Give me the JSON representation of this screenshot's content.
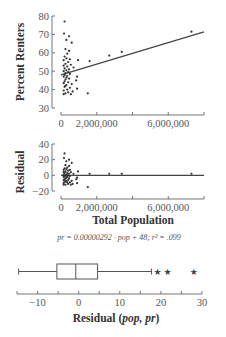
{
  "chart_data": [
    {
      "type": "scatter",
      "title": "",
      "xlabel": "",
      "ylabel": "Percent Renters",
      "xlim": [
        0,
        8000000
      ],
      "ylim": [
        30,
        80
      ],
      "x_ticks": [
        0,
        2000000,
        4000000,
        6000000,
        8000000
      ],
      "x_tick_labels": [
        "0",
        "2,000,000",
        "",
        "6,000,000",
        ""
      ],
      "y_ticks": [
        30,
        40,
        50,
        60,
        70,
        80
      ],
      "y_tick_labels": [
        "30",
        "40",
        "50",
        "60",
        "70",
        "80"
      ],
      "regression_line": {
        "x": [
          0,
          8000000
        ],
        "y": [
          48,
          71.4
        ]
      },
      "points": [
        [
          200000,
          77
        ],
        [
          170000,
          70.5
        ],
        [
          450000,
          69
        ],
        [
          300000,
          67
        ],
        [
          600000,
          65.5
        ],
        [
          250000,
          62
        ],
        [
          450000,
          61
        ],
        [
          350000,
          59.5
        ],
        [
          200000,
          58
        ],
        [
          300000,
          57
        ],
        [
          500000,
          56.5
        ],
        [
          950000,
          56
        ],
        [
          150000,
          56
        ],
        [
          400000,
          55
        ],
        [
          250000,
          54
        ],
        [
          550000,
          53.5
        ],
        [
          150000,
          53
        ],
        [
          350000,
          52.5
        ],
        [
          700000,
          52
        ],
        [
          200000,
          51.5
        ],
        [
          450000,
          51
        ],
        [
          300000,
          50.5
        ],
        [
          150000,
          50
        ],
        [
          400000,
          49.5
        ],
        [
          250000,
          49
        ],
        [
          500000,
          48.5
        ],
        [
          200000,
          48
        ],
        [
          350000,
          47.5
        ],
        [
          150000,
          47
        ],
        [
          900000,
          47
        ],
        [
          300000,
          46.5
        ],
        [
          450000,
          46
        ],
        [
          250000,
          45.5
        ],
        [
          850000,
          45
        ],
        [
          200000,
          44.5
        ],
        [
          400000,
          44
        ],
        [
          150000,
          43.5
        ],
        [
          600000,
          43
        ],
        [
          300000,
          42.5
        ],
        [
          250000,
          42
        ],
        [
          200000,
          41.5
        ],
        [
          500000,
          41
        ],
        [
          900000,
          40.5
        ],
        [
          350000,
          40
        ],
        [
          150000,
          39.5
        ],
        [
          650000,
          39
        ],
        [
          400000,
          38.5
        ],
        [
          250000,
          38
        ],
        [
          150000,
          37.5
        ],
        [
          550000,
          37.5
        ],
        [
          1600000,
          55.5
        ],
        [
          2700000,
          58.5
        ],
        [
          3400000,
          60.5
        ],
        [
          7300000,
          71.5
        ],
        [
          1500000,
          38
        ]
      ]
    },
    {
      "type": "scatter",
      "title": "",
      "xlabel": "Total Population",
      "ylabel": "Residual",
      "xlim": [
        0,
        8000000
      ],
      "ylim": [
        -20,
        40
      ],
      "x_ticks": [
        0,
        2000000,
        4000000,
        6000000,
        8000000
      ],
      "x_tick_labels": [
        "0",
        "2,000,000",
        "",
        "6,000,000",
        ""
      ],
      "y_ticks": [
        -20,
        0,
        20,
        40
      ],
      "y_tick_labels": [
        "−20",
        "0",
        "20",
        "40"
      ],
      "zero_line": true,
      "points": [
        [
          200000,
          28
        ],
        [
          170000,
          22
        ],
        [
          450000,
          20
        ],
        [
          300000,
          18
        ],
        [
          600000,
          16
        ],
        [
          250000,
          13
        ],
        [
          450000,
          12
        ],
        [
          350000,
          10
        ],
        [
          200000,
          9
        ],
        [
          300000,
          8
        ],
        [
          500000,
          7
        ],
        [
          950000,
          5
        ],
        [
          150000,
          7
        ],
        [
          400000,
          6
        ],
        [
          250000,
          5
        ],
        [
          550000,
          4
        ],
        [
          150000,
          4
        ],
        [
          350000,
          3
        ],
        [
          700000,
          2
        ],
        [
          200000,
          3
        ],
        [
          450000,
          2
        ],
        [
          300000,
          1
        ],
        [
          150000,
          1
        ],
        [
          400000,
          0
        ],
        [
          250000,
          0
        ],
        [
          500000,
          -1
        ],
        [
          200000,
          -1
        ],
        [
          350000,
          -2
        ],
        [
          150000,
          -2
        ],
        [
          900000,
          -3
        ],
        [
          300000,
          -3
        ],
        [
          450000,
          -4
        ],
        [
          250000,
          -4
        ],
        [
          850000,
          -5
        ],
        [
          200000,
          -5
        ],
        [
          400000,
          -6
        ],
        [
          150000,
          -6
        ],
        [
          600000,
          -7
        ],
        [
          300000,
          -7
        ],
        [
          250000,
          -8
        ],
        [
          200000,
          -8
        ],
        [
          500000,
          -9
        ],
        [
          900000,
          -10
        ],
        [
          350000,
          -9
        ],
        [
          150000,
          -10
        ],
        [
          650000,
          -11
        ],
        [
          400000,
          -11
        ],
        [
          250000,
          -12
        ],
        [
          150000,
          -12
        ],
        [
          550000,
          -12
        ],
        [
          1600000,
          2
        ],
        [
          2700000,
          2
        ],
        [
          3400000,
          2
        ],
        [
          7300000,
          2
        ],
        [
          1500000,
          -15
        ]
      ],
      "annotation": "pr = 0.00000292 · pop + 48; r² = .099"
    },
    {
      "type": "boxplot",
      "title": "",
      "xlabel": "Residual (pop, pr)",
      "xlim": [
        -15,
        30
      ],
      "x_ticks": [
        -15,
        -10,
        -5,
        0,
        5,
        10,
        15,
        20,
        25,
        30
      ],
      "x_tick_labels": [
        "",
        "−10",
        "",
        "0",
        "",
        "10",
        "",
        "20",
        "",
        "30"
      ],
      "whisker_low": -14.6,
      "q1": -5.3,
      "median": -0.7,
      "q3": 4.6,
      "whisker_high": 17.7,
      "outliers": [
        19.2,
        21.6,
        28
      ],
      "outlier_marker": "star"
    }
  ],
  "labels": {
    "scatter_ylabel": "Percent Renters",
    "residual_ylabel": "Residual",
    "residual_xlabel": "Total Population",
    "equation": "pr = 0.00000292 · pop + 48; r² = .099",
    "box_xlabel_prefix": "Residual (",
    "box_xlabel_vars": "pop, pr",
    "box_xlabel_suffix": ")"
  }
}
